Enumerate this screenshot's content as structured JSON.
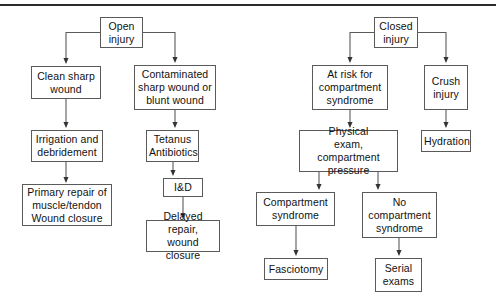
{
  "diagram": {
    "line_color": "#5a5a5a",
    "text_color": "#111111",
    "background": "#ffffff",
    "top_rule_color": "#2b2b2b"
  },
  "nodes": {
    "open_injury": "Open\ninjury",
    "clean_sharp_wound": "Clean sharp\nwound",
    "contaminated_wound": "Contaminated\nsharp wound or\nblunt wound",
    "irrigation_debridement": "Irrigation and\ndebridement",
    "tetanus_antibiotics": "Tetanus\nAntibiotics",
    "primary_repair": "Primary repair of\nmuscle/tendon\nWound closure",
    "incision_drainage": "I&D",
    "delayed_repair": "Delayed repair,\nwound closure",
    "closed_injury": "Closed\ninjury",
    "at_risk_compartment": "At risk for\ncompartment\nsyndrome",
    "crush_injury": "Crush\ninjury",
    "physical_exam": "Physical\nexam, compartment\npressure",
    "hydration": "Hydration",
    "compartment_syndrome": "Compartment\nsyndrome",
    "no_compartment_syndrome": "No\ncompartment\nsyndrome",
    "fasciotomy": "Fasciotomy",
    "serial_exams": "Serial\nexams"
  },
  "chart_data": {
    "type": "diagram",
    "layout": "top-down flowchart, two independent trees",
    "trees": [
      {
        "root": "Open injury",
        "edges": [
          [
            "Open injury",
            "Clean sharp wound"
          ],
          [
            "Open injury",
            "Contaminated sharp wound or blunt wound"
          ],
          [
            "Clean sharp wound",
            "Irrigation and debridement"
          ],
          [
            "Irrigation and debridement",
            "Primary repair of muscle/tendon Wound closure"
          ],
          [
            "Contaminated sharp wound or blunt wound",
            "Tetanus Antibiotics"
          ],
          [
            "Tetanus Antibiotics",
            "I&D"
          ],
          [
            "I&D",
            "Delayed repair, wound closure"
          ]
        ]
      },
      {
        "root": "Closed injury",
        "edges": [
          [
            "Closed injury",
            "At risk for compartment syndrome"
          ],
          [
            "Closed injury",
            "Crush injury"
          ],
          [
            "At risk for compartment syndrome",
            "Physical exam, compartment pressure"
          ],
          [
            "Crush injury",
            "Hydration"
          ],
          [
            "Physical exam, compartment pressure",
            "Compartment syndrome"
          ],
          [
            "Physical exam, compartment pressure",
            "No compartment syndrome"
          ],
          [
            "Compartment syndrome",
            "Fasciotomy"
          ],
          [
            "No compartment syndrome",
            "Serial exams"
          ]
        ]
      }
    ]
  }
}
